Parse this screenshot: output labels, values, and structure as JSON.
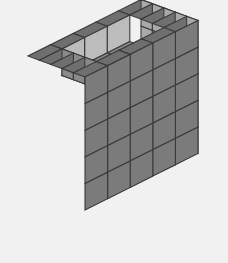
{
  "scene": {
    "title": "Isometric Unit-Cube Stack",
    "description": "A 5x5x5 stack of unit cubes rendered in isometric projection with a rectangular cavity recessed into the top face.",
    "background_color": "#f1f1f1"
  },
  "canvas": {
    "width": 228,
    "height": 263
  },
  "projection": {
    "type": "isometric",
    "origin_x": 85,
    "origin_y": 210,
    "unit_x_dx": 22.6,
    "unit_x_dy": -11.3,
    "unit_y_dx": -11.4,
    "unit_y_dy": -4.2,
    "unit_z_dx": 0,
    "unit_z_dy": -26.6,
    "note": "x runs to the upper-right (front/right face), y runs to the upper-left (left face), z runs straight up"
  },
  "geometry": {
    "grid_x": 5,
    "grid_y": 5,
    "grid_z": 5,
    "total_columns": 25,
    "cavity": {
      "present": true,
      "depth_levels": 1,
      "x_range": [
        1,
        4
      ],
      "y_range": [
        1,
        4
      ],
      "removed_cubes": 9
    },
    "visible_cube_count": 116
  },
  "colors": {
    "top_face": "#6f6f6f",
    "left_face": "#7b7b7b",
    "right_face": "#a9a9a9",
    "cavity_floor": "#8d8d8d",
    "cavity_wall_left": "#bcbcbc",
    "cavity_wall_right": "#8a8a8a",
    "edge_stroke": "#3a3a3a",
    "background": "#f1f1f1"
  },
  "render": {
    "stroke_width": 1.1,
    "shading_model": "flat-lambert",
    "light_direction": "upper-right"
  },
  "labels": {
    "figure_caption": "",
    "axis_x": "",
    "axis_y": "",
    "axis_z": ""
  }
}
